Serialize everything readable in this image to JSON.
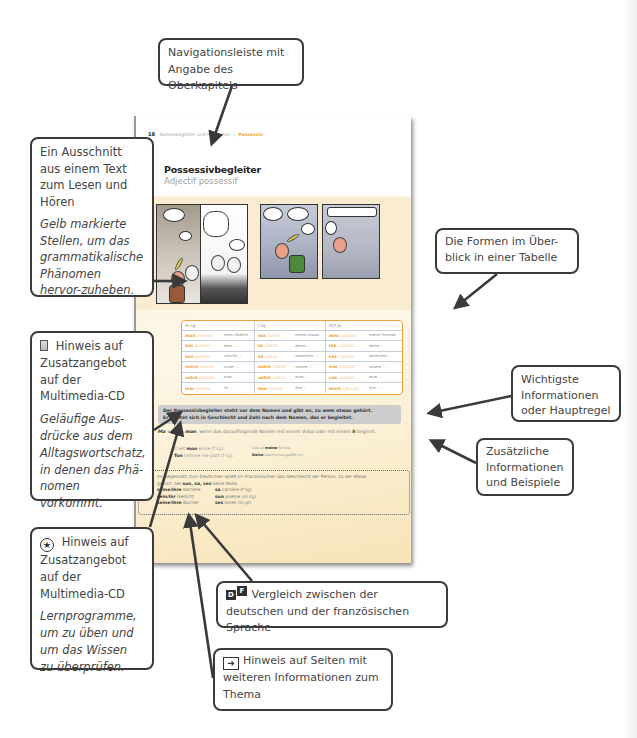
{
  "book_page": {
    "nav": {
      "page_number": "18",
      "parent_chapter": "Nomenbegleiter und Pronomen",
      "separator": "|",
      "current_chapter": "Possessiv"
    },
    "title_de": "Possessivbegleiter",
    "title_fr": "Adjectif possessif",
    "comic": {
      "audio_icon": "play-circle-icon",
      "panel_count": 4
    },
    "forms_table": {
      "headers": [
        "m sg",
        "f sg",
        "m/f pl"
      ],
      "rows": [
        [
          {
            "poss": "mon",
            "noun": "poème",
            "de": "mein Gedicht"
          },
          {
            "poss": "ma",
            "noun": "classe",
            "de": "meine Klasse"
          },
          {
            "poss": "mes",
            "noun": "copains",
            "de": "meine Freunde"
          }
        ],
        [
          {
            "poss": "ton",
            "noun": "poème",
            "de": "dein ..."
          },
          {
            "poss": "ta",
            "noun": "classe",
            "de": "deine ..."
          },
          {
            "poss": "tes",
            "noun": "copains",
            "de": "deine ..."
          }
        ],
        [
          {
            "poss": "son",
            "noun": "poème",
            "de": "sein/ihr ..."
          },
          {
            "poss": "sa",
            "noun": "classe",
            "de": "seine/ihre ..."
          },
          {
            "poss": "ses",
            "noun": "copains",
            "de": "seine/ihre ..."
          }
        ],
        [
          {
            "poss": "notre",
            "noun": "poème",
            "de": "unser ..."
          },
          {
            "poss": "notre",
            "noun": "classe",
            "de": "unsere ..."
          },
          {
            "poss": "nos",
            "noun": "copains",
            "de": "unsere ..."
          }
        ],
        [
          {
            "poss": "votre",
            "noun": "poème",
            "de": "euer ..."
          },
          {
            "poss": "votre",
            "noun": "classe",
            "de": "eure ..."
          },
          {
            "poss": "vos",
            "noun": "copains",
            "de": "eure ..."
          }
        ],
        [
          {
            "poss": "leur",
            "noun": "poème",
            "de": "ihr ..."
          },
          {
            "poss": "leur",
            "noun": "classe",
            "de": "ihre ..."
          },
          {
            "poss": "leurs",
            "noun": "copains",
            "de": "ihre ..."
          }
        ]
      ]
    },
    "main_rule": {
      "line1": "Der Possessivbegleiter steht vor dem Nomen und gibt an, zu wem etwas gehört.",
      "line2": "Er richtet sich in Geschlecht und Zahl nach dem Nomen, das er begleitet."
    },
    "extra_info": {
      "ma": "Ma",
      "text1": " wird zu ",
      "mon": "mon",
      "text2": ", wenn das darauffolgende Nomen mit einem Vokal oder mit einem ",
      "h": "h",
      "text3": " beginnt.",
      "examples": [
        {
          "fr_pre": "C'est ",
          "fr_poss": "mon",
          "fr_rest": " école (f sg).",
          "de_pre": "Das ist ",
          "de_poss": "meine",
          "de_rest": " Schule."
        },
        {
          "fr_pre": "",
          "fr_poss": "Ton",
          "fr_rest": " histoire me plaît (f sg).",
          "de_pre": "",
          "de_poss": "Deine",
          "de_rest": " Geschichte gefällt mir."
        }
      ]
    },
    "contrast": {
      "line1": "Im Gegensatz zum Deutschen spielt im Französischen das Geschlecht der Person, zu der etwas",
      "line2_pre": "gehört, bei ",
      "line2_bold": "son, sa, ses",
      "line2_post": " keine Rolle.",
      "rows": [
        {
          "de_bold": "seine/ihre",
          "de_rest": " Karriere",
          "fr_bold": "sa",
          "fr_rest": " carrière (f sg)"
        },
        {
          "de_bold": "sein/ihr",
          "de_rest": " Gedicht",
          "fr_bold": "son",
          "fr_rest": " poème (m sg)"
        },
        {
          "de_bold": "seine/ihre",
          "de_rest": " Bücher",
          "fr_bold": "ses",
          "fr_rest": " livres (m pl)"
        }
      ]
    },
    "margin_icons": [
      "cd-icon",
      "star-circle-icon",
      "page-reference-icon",
      "de-fr-comparison-icon",
      "page-reference-icon"
    ]
  },
  "callouts": {
    "navigation": "Navigationsleiste mit Angabe des Oberkapitels",
    "text_excerpt": {
      "title": "Ein Ausschnitt aus einem Text zum Lesen und Hören",
      "italic": "Gelb markierte Stellen, um das grammatikalische Phänomen hervor-zuheben."
    },
    "table": "Die Formen im Über-blick in einer Tabelle",
    "cd_expressions": {
      "title": "Hinweis auf Zusatzangebot auf der Multimedia-CD",
      "italic": "Geläufige Aus-drücke aus dem Alltagswortschatz, in denen das Phä-nomen vorkommt."
    },
    "main_rule": "Wichtigste Informationen oder Hauptregel",
    "extra_info": "Zusätzliche Informationen und Beispiele",
    "cd_programs": {
      "title": "Hinweis auf Zusatzangebot auf der Multimedia-CD",
      "italic": "Lernprogramme, um zu üben und um das Wissen zu überprüfen."
    },
    "comparison": {
      "icon_d": "D",
      "icon_f": "F",
      "text": "Vergleich zwischen der deutschen und der französischen Sprache"
    },
    "page_reference": "Hinweis auf Seiten mit weiteren Informationen zum Thema"
  },
  "colors": {
    "accent_orange": "#f0a030",
    "highlight_bg": "#f9ecd0",
    "rule_box": "#cdcdcd",
    "callout_border": "#3a3a3a"
  }
}
